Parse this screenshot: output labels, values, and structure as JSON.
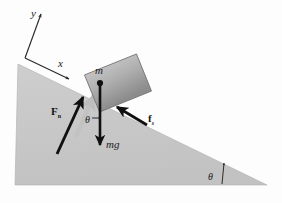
{
  "figure": {
    "background_color": "#fdfdfd"
  },
  "incline": {
    "name": "inclined-plane",
    "fill_color": "#c9c9c9",
    "edge_color": "#b0b0b0",
    "apex": [
      18,
      64
    ],
    "bottom_left": [
      15,
      185
    ],
    "bottom_right": [
      267,
      185
    ],
    "angle_label": "θ"
  },
  "block": {
    "name": "block",
    "mass_label": "m",
    "fill_top_color": "#b8b8b8",
    "fill_bottom_color": "#8f8f8f",
    "edge_color": "#6e6e6e",
    "center": [
      118,
      83
    ],
    "width": 56,
    "height": 40,
    "rotation_deg": -22
  },
  "axes": {
    "name": "coordinate-axes",
    "x_label": "x",
    "y_label": "y",
    "origin": [
      25,
      58
    ],
    "x_tip": [
      70,
      78
    ],
    "y_tip": [
      40,
      12
    ],
    "color": "#2a2a2a"
  },
  "forces": [
    {
      "name": "normal-force",
      "label": "F",
      "subscript": "n",
      "subscript_italic": false,
      "color": "#101010",
      "tail": [
        57,
        153
      ],
      "tip": [
        82,
        98
      ],
      "label_pos": [
        55,
        112
      ]
    },
    {
      "name": "weight-force",
      "label": "mg",
      "subscript": "",
      "color": "#101010",
      "tail": [
        100,
        83
      ],
      "tip": [
        100,
        146
      ],
      "label_pos": [
        106,
        145
      ]
    },
    {
      "name": "static-friction-force",
      "label": "f",
      "subscript": "s",
      "subscript_italic": true,
      "color": "#101010",
      "tail": [
        145,
        124
      ],
      "tip": [
        118,
        108
      ],
      "label_pos": [
        146,
        120
      ]
    }
  ],
  "shadow_vector": {
    "name": "normal-force-shadow",
    "color": "#bdbdbd",
    "tail": [
      74,
      135
    ],
    "tip": [
      93,
      94
    ]
  },
  "angles": [
    {
      "name": "angle-theta-block",
      "label": "θ",
      "pos": [
        90,
        122
      ]
    },
    {
      "name": "angle-theta-incline",
      "label": "θ",
      "pos": [
        213,
        175
      ]
    }
  ]
}
